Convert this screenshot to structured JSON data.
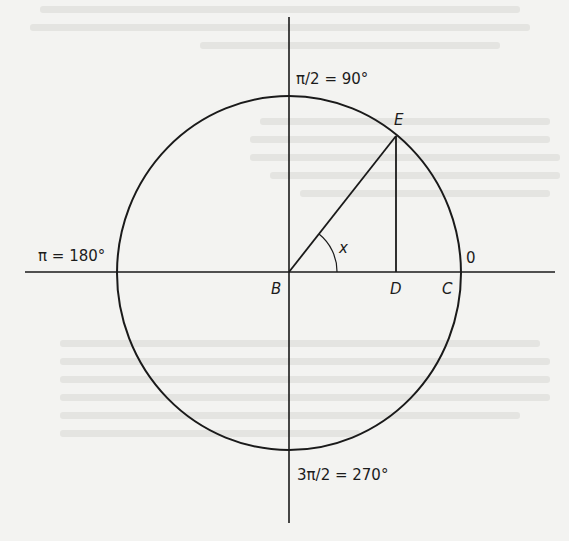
{
  "diagram": {
    "type": "unit-circle",
    "labels": {
      "top": "π/2 = 90°",
      "left": "π = 180°",
      "bottom": "3π/2 = 270°",
      "right": "0"
    },
    "points": {
      "center": "B",
      "foot": "D",
      "circle_right": "C",
      "circle_point": "E"
    },
    "angle_label": "x"
  }
}
